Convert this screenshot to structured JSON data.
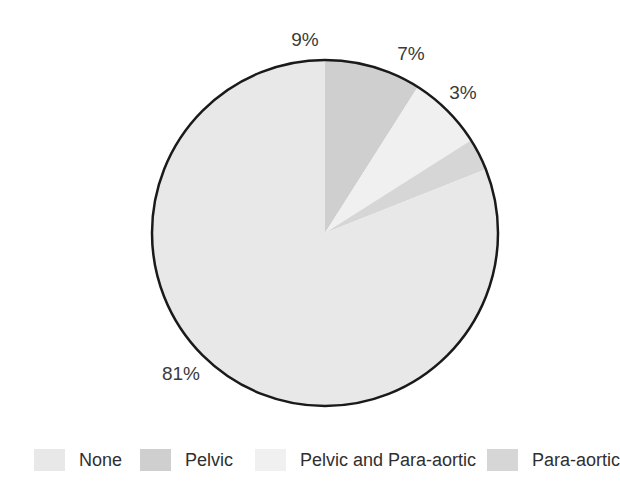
{
  "chart_data": {
    "type": "pie",
    "title": "",
    "subtitle": "",
    "xlabel": "",
    "ylabel": "",
    "legend_position": "bottom",
    "grid": false,
    "categories": [
      "None",
      "Pelvic",
      "Pelvic and Para-aortic",
      "Para-aortic"
    ],
    "values": [
      81,
      9,
      7,
      3
    ],
    "value_labels": [
      "81%",
      "9%",
      "7%",
      "3%"
    ],
    "colors": [
      "#e8e8e8",
      "#cfcfcf",
      "#f0f0f0",
      "#d6d6d6"
    ],
    "slices": [
      {
        "label": "Pelvic",
        "value": 9,
        "value_label": "9%",
        "color": "#cfcfcf",
        "start_angle_deg": 0,
        "end_angle_deg": 32.4,
        "label_x": 305,
        "label_y": 40
      },
      {
        "label": "Pelvic and Para-aortic",
        "value": 7,
        "value_label": "7%",
        "color": "#f0f0f0",
        "start_angle_deg": 32.4,
        "end_angle_deg": 57.6,
        "label_x": 411,
        "label_y": 54
      },
      {
        "label": "Para-aortic",
        "value": 3,
        "value_label": "3%",
        "color": "#d6d6d6",
        "start_angle_deg": 57.6,
        "end_angle_deg": 68.4,
        "label_x": 463,
        "label_y": 93
      },
      {
        "label": "None",
        "value": 81,
        "value_label": "81%",
        "color": "#e8e8e8",
        "start_angle_deg": 68.4,
        "end_angle_deg": 360,
        "label_x": 181,
        "label_y": 374
      }
    ],
    "geometry": {
      "center_x": 325,
      "center_y": 233,
      "radius": 173,
      "outline_color": "#1a1a1a",
      "outline_width": 2.5
    }
  },
  "legend": {
    "items": [
      {
        "label": "None",
        "color": "#e8e8e8",
        "left": 34
      },
      {
        "label": "Pelvic",
        "color": "#cfcfcf",
        "left": 140
      },
      {
        "label": "Pelvic and Para-aortic",
        "color": "#f0f0f0",
        "left": 255
      },
      {
        "label": "Para-aortic",
        "color": "#d6d6d6",
        "left": 487
      }
    ]
  }
}
